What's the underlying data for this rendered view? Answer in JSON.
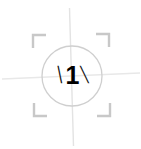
{
  "widget": {
    "name": "focus-reticle",
    "center_value": "1",
    "tick_left": "\\",
    "tick_right": "\\",
    "background_color": "#ffffff",
    "circle_color": "#cfcfcf",
    "bracket_color": "#c8c8c8",
    "crosshair_color": "#e6e6e6",
    "digit_color": "#000000"
  },
  "geometry": {
    "circle_center_x": 72,
    "circle_center_y": 76,
    "circle_radius": 30,
    "vertical_line_top_y": 8,
    "vertical_line_bottom_y": 146,
    "horizontal_line_left_x": 2,
    "horizontal_line_right_x": 140
  },
  "brackets": [
    {
      "name": "top-left",
      "corner": "┌"
    },
    {
      "name": "top-right",
      "corner": "┐"
    },
    {
      "name": "bottom-left",
      "corner": "└"
    },
    {
      "name": "bottom-right",
      "corner": "┘"
    }
  ]
}
